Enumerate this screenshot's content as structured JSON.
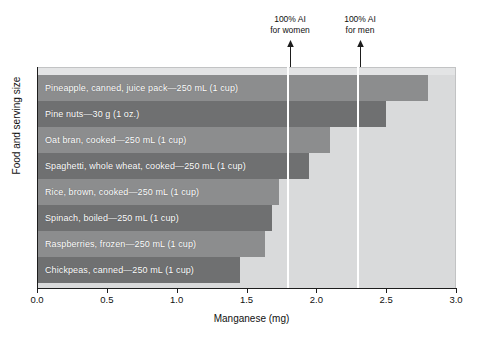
{
  "chart_data": {
    "type": "bar",
    "orientation": "horizontal",
    "title": "",
    "xlabel": "Manganese (mg)",
    "ylabel": "Food and serving size",
    "xlim": [
      0.0,
      3.0
    ],
    "xticks": [
      "0.0",
      "0.5",
      "1.0",
      "1.5",
      "2.0",
      "2.5",
      "3.0"
    ],
    "xtick_values": [
      0.0,
      0.5,
      1.0,
      1.5,
      2.0,
      2.5,
      3.0
    ],
    "grid": false,
    "legend": "none",
    "categories": [
      "Pineapple, canned, juice pack—250 mL (1 cup)",
      "Pine nuts—30 g (1 oz.)",
      "Oat bran, cooked—250 mL (1 cup)",
      "Spaghetti, whole wheat, cooked—250 mL (1 cup)",
      "Rice, brown, cooked—250 mL (1 cup)",
      "Spinach, boiled—250 mL (1 cup)",
      "Raspberries, frozen—250 mL (1 cup)",
      "Chickpeas, canned—250 mL (1 cup)"
    ],
    "values": [
      2.8,
      2.5,
      2.1,
      1.95,
      1.73,
      1.68,
      1.63,
      1.45
    ],
    "bar_colors": [
      "#8c8d8e",
      "#6f7071",
      "#8c8d8e",
      "#6f7071",
      "#8c8d8e",
      "#6f7071",
      "#8c8d8e",
      "#6f7071"
    ],
    "plot_background": "#d9dadb",
    "annotations": [
      {
        "label_line1": "100% AI",
        "label_line2": "for women",
        "value": 1.8,
        "color": "#ffffff"
      },
      {
        "label_line1": "100% AI",
        "label_line2": "for men",
        "value": 2.3,
        "color": "#ffffff"
      }
    ]
  },
  "bars": [
    {
      "label": "Pineapple, canned, juice pack—250 mL (1 cup)",
      "value": 2.8,
      "color": "#8c8d8e"
    },
    {
      "label": "Pine nuts—30 g (1 oz.)",
      "value": 2.5,
      "color": "#6f7071"
    },
    {
      "label": "Oat bran, cooked—250 mL (1 cup)",
      "value": 2.1,
      "color": "#8c8d8e"
    },
    {
      "label": "Spaghetti, whole wheat, cooked—250 mL (1 cup)",
      "value": 1.95,
      "color": "#6f7071"
    },
    {
      "label": "Rice, brown, cooked—250 mL (1 cup)",
      "value": 1.73,
      "color": "#8c8d8e"
    },
    {
      "label": "Spinach, boiled—250 mL (1 cup)",
      "value": 1.68,
      "color": "#6f7071"
    },
    {
      "label": "Raspberries, frozen—250 mL (1 cup)",
      "value": 1.63,
      "color": "#8c8d8e"
    },
    {
      "label": "Chickpeas, canned—250 mL (1 cup)",
      "value": 1.45,
      "color": "#6f7071"
    }
  ],
  "axes": {
    "x_title": "Manganese (mg)",
    "y_title": "Food and serving size",
    "ticks": [
      "0.0",
      "0.5",
      "1.0",
      "1.5",
      "2.0",
      "2.5",
      "3.0"
    ]
  },
  "annotations": {
    "women": {
      "line1": "100% AI",
      "line2": "for women"
    },
    "men": {
      "line1": "100% AI",
      "line2": "for men"
    }
  },
  "caption": ""
}
